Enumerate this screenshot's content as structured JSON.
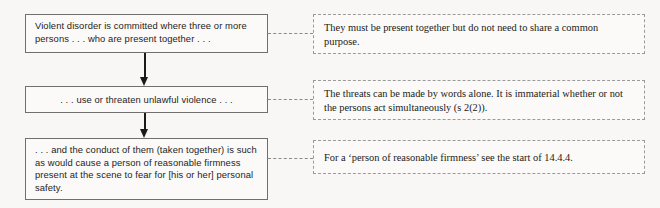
{
  "diagram": {
    "flow_steps": [
      {
        "id": "step-1",
        "text": "Violent disorder is committed where three or more persons . . . who are present together . . ."
      },
      {
        "id": "step-2",
        "text": ". . . use or threaten unlawful violence . . ."
      },
      {
        "id": "step-3",
        "text": ". . . and the conduct of them (taken together) is such as would cause a person of reasonable firmness present at the scene to fear for [his or her] personal safety."
      }
    ],
    "notes": [
      {
        "id": "note-1",
        "text": "They must be present together but do not need to share a common purpose."
      },
      {
        "id": "note-2",
        "text": "The threats can be made by words alone. It is immaterial whether or not the persons act simultaneously (s 2(2))."
      },
      {
        "id": "note-3",
        "text": "For a ‘person of reasonable firmness’ see the start of 14.4.4."
      }
    ],
    "colors": {
      "background": "#f8f7f5",
      "box_border": "#6f6f6f",
      "note_border": "#9a9a9a",
      "arrow": "#1a1a1a",
      "text": "#1d1d1d"
    }
  }
}
